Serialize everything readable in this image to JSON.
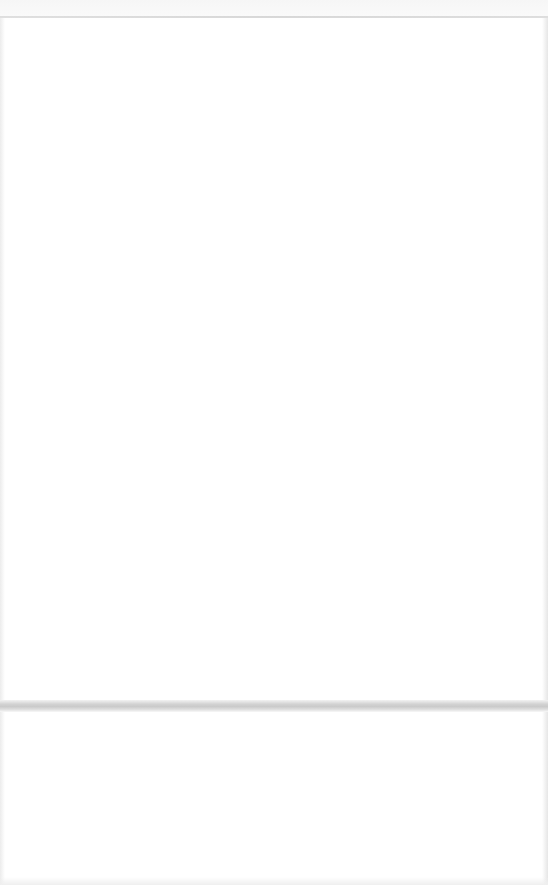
{
  "document": {
    "type": "scanned-page",
    "state": "blank",
    "visible_text": "",
    "show_through": {
      "legible": false,
      "text": ""
    },
    "colors": {
      "paper": "#ffffff",
      "edge_line": "#d4d4d4",
      "fold_shadow": "#cccccc"
    }
  }
}
